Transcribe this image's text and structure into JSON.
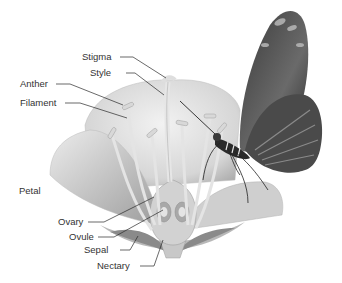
{
  "diagram": {
    "labels": [
      {
        "id": "stigma",
        "text": "Stigma"
      },
      {
        "id": "style",
        "text": "Style"
      },
      {
        "id": "anther",
        "text": "Anther"
      },
      {
        "id": "filament",
        "text": "Filament"
      },
      {
        "id": "petal",
        "text": "Petal"
      },
      {
        "id": "ovary",
        "text": "Ovary"
      },
      {
        "id": "ovule",
        "text": "Ovule"
      },
      {
        "id": "sepal",
        "text": "Sepal"
      },
      {
        "id": "nectary",
        "text": "Nectary"
      }
    ],
    "colors": {
      "background": "#ffffff",
      "label_text": "#333333",
      "leader_line": "#2a2a2a",
      "petal_light": "#e8e8e8",
      "petal_shade": "#b8b8b8",
      "butterfly_dark": "#2b2b2b"
    }
  }
}
